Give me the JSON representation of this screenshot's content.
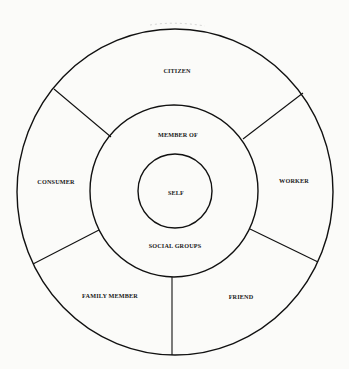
{
  "diagram": {
    "center": {
      "label": "SELF"
    },
    "middle_ring": {
      "top_label": "MEMBER OF",
      "bottom_label": "SOCIAL GROUPS"
    },
    "outer_ring": {
      "segments": [
        {
          "label": "CITIZEN"
        },
        {
          "label": "WORKER"
        },
        {
          "label": "FRIEND"
        },
        {
          "label": "FAMILY MEMBER"
        },
        {
          "label": "CONSUMER"
        }
      ]
    }
  }
}
